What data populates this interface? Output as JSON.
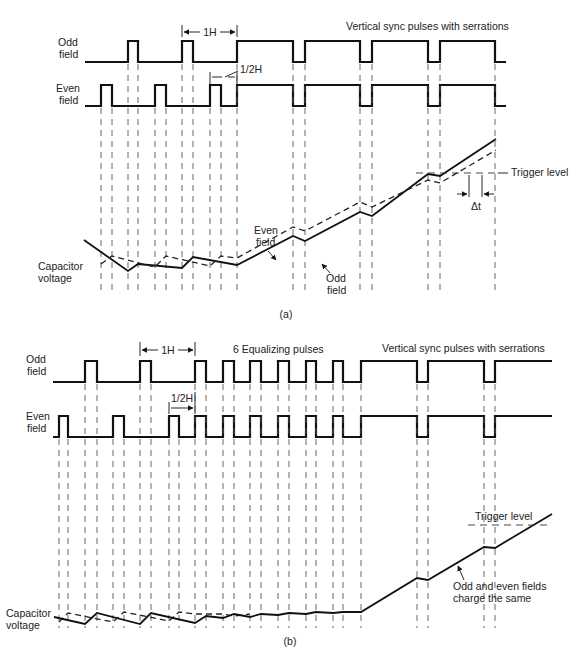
{
  "figure_a": {
    "caption": "(a)",
    "odd_label_1": "Odd",
    "odd_label_2": "field",
    "even_label_1": "Even",
    "even_label_2": "field",
    "cap_label_1": "Capacitor",
    "cap_label_2": "voltage",
    "one_h": "1H",
    "half_h": "1/2H",
    "vsync_title": "Vertical sync pulses with serrations",
    "even_field_curve_1": "Even",
    "even_field_curve_2": "field",
    "odd_field_curve_1": "Odd",
    "odd_field_curve_2": "field",
    "trigger": "Trigger level",
    "delta_t": "Δt"
  },
  "figure_b": {
    "caption": "(b)",
    "odd_label_1": "Odd",
    "odd_label_2": "field",
    "even_label_1": "Even",
    "even_label_2": "field",
    "cap_label_1": "Capacitor",
    "cap_label_2": "voltage",
    "one_h": "1H",
    "half_h": "1/2H",
    "equalizing_title": "6 Equalizing pulses",
    "vsync_title": "Vertical sync pulses with serrations",
    "trigger": "Trigger level",
    "note_1": "Odd and even fields",
    "note_2": "charge the same"
  }
}
